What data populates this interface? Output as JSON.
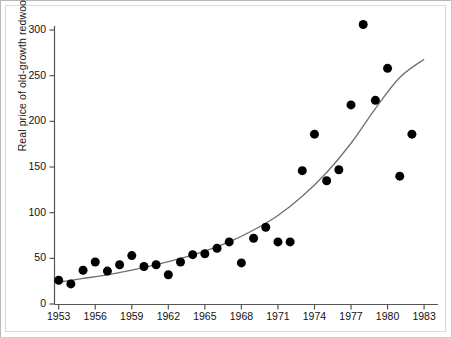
{
  "chart_data": {
    "type": "scatter",
    "title": "",
    "subtitle": "",
    "xlabel": "",
    "ylabel": "Real price of old-growth redwoods",
    "xlim": [
      1952.2,
      1984.0
    ],
    "ylim": [
      0,
      315
    ],
    "xticks": [
      1953,
      1956,
      1959,
      1962,
      1965,
      1968,
      1971,
      1974,
      1977,
      1980,
      1983
    ],
    "xtick_labels": [
      "1953",
      "1956",
      "1959",
      "1962",
      "1965",
      "1968",
      "1971",
      "1974",
      "1977",
      "1980",
      "1983"
    ],
    "yticks": [
      0,
      50,
      100,
      150,
      200,
      250,
      300
    ],
    "ytick_labels": [
      "0",
      "50",
      "100",
      "150",
      "200",
      "250",
      "300"
    ],
    "grid": false,
    "legend": null,
    "marker": {
      "shape": "circle",
      "color": "#000000",
      "size": 5.2
    },
    "x": [
      1953,
      1954,
      1955,
      1956,
      1957,
      1958,
      1959,
      1960,
      1961,
      1962,
      1963,
      1964,
      1965,
      1966,
      1967,
      1968,
      1969,
      1970,
      1971,
      1972,
      1973,
      1974,
      1975,
      1976,
      1977,
      1978,
      1979,
      1980,
      1981,
      1982
    ],
    "y": [
      26,
      22,
      37,
      46,
      36,
      43,
      53,
      41,
      43,
      32,
      46,
      54,
      55,
      61,
      68,
      45,
      72,
      84,
      68,
      68,
      146,
      186,
      135,
      147,
      218,
      306,
      223,
      258,
      140,
      186
    ],
    "series": [
      {
        "name": "Real price of old-growth redwoods",
        "type": "scatter",
        "x": [
          1953,
          1954,
          1955,
          1956,
          1957,
          1958,
          1959,
          1960,
          1961,
          1962,
          1963,
          1964,
          1965,
          1966,
          1967,
          1968,
          1969,
          1970,
          1971,
          1972,
          1973,
          1974,
          1975,
          1976,
          1977,
          1978,
          1979,
          1980,
          1981,
          1982
        ],
        "y": [
          26,
          22,
          37,
          46,
          36,
          43,
          53,
          41,
          43,
          32,
          46,
          54,
          55,
          61,
          68,
          45,
          72,
          84,
          68,
          68,
          146,
          186,
          135,
          147,
          218,
          306,
          223,
          258,
          140,
          186
        ]
      },
      {
        "name": "fitted exponential trend",
        "type": "line",
        "color": "#6b6b6b",
        "x": [
          1953,
          1955,
          1957,
          1959,
          1961,
          1963,
          1965,
          1967,
          1969,
          1971,
          1973,
          1975,
          1977,
          1979,
          1981,
          1983
        ],
        "y": [
          24,
          28,
          32,
          37,
          43,
          50,
          58,
          68,
          81,
          97,
          118,
          144,
          176,
          214,
          248,
          268
        ]
      }
    ]
  }
}
